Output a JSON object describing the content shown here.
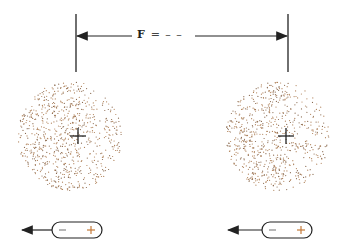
{
  "diagram": {
    "force_label": "F",
    "force_suffix": "= – –",
    "colors": {
      "line": "#222222",
      "dots": "#b0825a",
      "dots_dark": "#8a6a50",
      "plus": "#c47a3a",
      "minus": "#888888"
    },
    "charges": [
      {
        "id": "left",
        "center_x": 78,
        "center_y": 136,
        "radius": 52,
        "capsule": {
          "minus": "−",
          "plus": "+"
        }
      },
      {
        "id": "right",
        "center_x": 286,
        "center_y": 136,
        "radius": 52,
        "capsule": {
          "minus": "−",
          "plus": "+"
        }
      }
    ]
  }
}
